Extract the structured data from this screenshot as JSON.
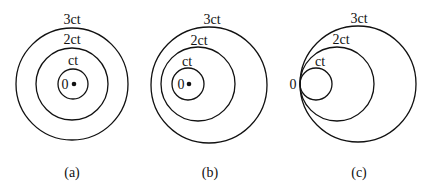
{
  "panels": [
    {
      "caption": "(a)",
      "origin_label": "0",
      "rings": [
        {
          "label": "ct",
          "cx": 73,
          "cy": 84,
          "r": 15
        },
        {
          "label": "2ct",
          "cx": 72,
          "cy": 84,
          "r": 36
        },
        {
          "label": "3ct",
          "cx": 72,
          "cy": 84,
          "r": 56
        }
      ],
      "dot": {
        "cx": 74,
        "cy": 84
      }
    },
    {
      "caption": "(b)",
      "origin_label": "0",
      "rings": [
        {
          "label": "ct",
          "cx": 188,
          "cy": 84,
          "r": 16
        },
        {
          "label": "2ct",
          "cx": 198,
          "cy": 84,
          "r": 37
        },
        {
          "label": "3ct",
          "cx": 209,
          "cy": 85,
          "r": 58
        }
      ],
      "dot": {
        "cx": 189,
        "cy": 84
      }
    },
    {
      "caption": "(c)",
      "origin_label": "0",
      "rings": [
        {
          "label": "ct",
          "cx": 316,
          "cy": 84,
          "r": 16
        },
        {
          "label": "2ct",
          "cx": 337,
          "cy": 84,
          "r": 37
        },
        {
          "label": "3ct",
          "cx": 358,
          "cy": 84,
          "r": 58
        }
      ]
    }
  ],
  "colors": {
    "stroke": "#111111",
    "background": "#ffffff"
  }
}
